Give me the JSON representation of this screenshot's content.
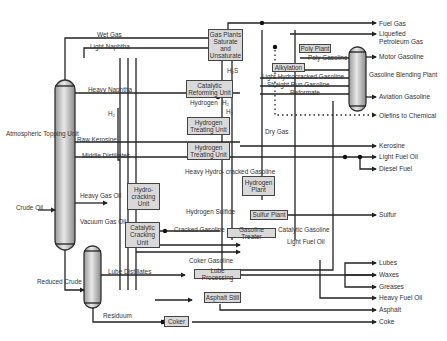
{
  "diagram": {
    "feeds": {
      "crude_oil": "Crude\nOil",
      "atmospheric_topping_unit": "Atmospheric\nTopping Unit",
      "reduced_crude": "Reduced\nCrude",
      "vacuum_gas_oil": "Vacuum\nGas Oil",
      "heavy_gas_oil": "Heavy\nGas Oil",
      "residuum": "Residuum",
      "lube_distillates": "Lube Distillates"
    },
    "streams": {
      "wet_gas": "Wet Gas",
      "light_naphtha": "Light Naphtha",
      "heavy_naphtha": "Heavy Naphtha",
      "h2_left": "H₂",
      "raw_kerosine": "Raw Kerosine",
      "middle_distillates": "Middle\nDistillates",
      "h2s": "H₂S",
      "hydrogen": "Hydrogen",
      "h2_a": "H₂",
      "h2_b": "H₂",
      "dry_gas": "Dry\nGas",
      "heavy_hydrocracked_gasoline": "Heavy Hydro-\ncracked\nGasoline",
      "hydrogen_sulfide": "Hydrogen\nSulfide",
      "cracked_gasoline": "Cracked Gasoline",
      "catalytic_gasoline": "Catalytic Gasoline",
      "light_fuel_oil_mid": "Light Fuel Oil",
      "coker_gasoline": "Coker Gasoline",
      "poly_gasoline": "Poly Gasoline",
      "light_hydrocracked_gasoline": "Light Hydrocracked Gasoline",
      "straight_run_gasoline": "Straight Run Gasoline",
      "reformate": "Reformate",
      "gasoline_blending_plant": "Gasoline\nBlending Plant"
    },
    "units": {
      "gas_plants": "Gas Plants\nSaturate\nand\nUnsaturate",
      "poly_plant": "Poly Plant",
      "alkylation": "Alkylation",
      "catalytic_reforming": "Catalytic\nReforming Unit",
      "hydrogen_treating_1": "Hydrogen\nTreating Unit",
      "hydrogen_treating_2": "Hydrogen\nTreating Unit",
      "hydrogen_plant": "Hydrogen\nPlant",
      "hydrocracking": "Hydro-\ncracking\nUnit",
      "catalytic_cracking": "Catalytic\nCracking\nUnit",
      "sulfur_plant": "Sulfur Plant",
      "gasoline_treater": "Gasoline Treater",
      "lube_processing": "Lube Processing",
      "asphalt_still": "Asphalt Still",
      "coker": "Coker"
    },
    "products": {
      "fuel_gas": "Fuel Gas",
      "lpg": "Liquefied\nPetroleum Gas",
      "motor_gasoline": "Motor Gasoline",
      "aviation_gasoline": "Aviation Gasoline",
      "olefins": "Olefins to Chemical",
      "kerosine": "Kerosine",
      "light_fuel_oil": "Light Fuel Oil",
      "diesel_fuel": "Diesel Fuel",
      "sulfur": "Sulfur",
      "lubes": "Lubes",
      "waxes": "Waxes",
      "greases": "Greases",
      "heavy_fuel_oil": "Heavy  Fuel Oil",
      "asphalt": "Asphalt",
      "coke": "Coke"
    }
  }
}
